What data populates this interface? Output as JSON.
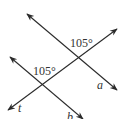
{
  "diagram": {
    "type": "parallel-lines-transversal",
    "lines": [
      {
        "name": "a",
        "label": "a",
        "from": [
          27,
          14
        ],
        "to": [
          117,
          90
        ]
      },
      {
        "name": "b",
        "label": "b",
        "from": [
          10,
          57
        ],
        "to": [
          83,
          119
        ]
      },
      {
        "name": "t",
        "label": "t",
        "from": [
          8,
          110
        ],
        "to": [
          117,
          29
        ]
      }
    ],
    "angles": [
      {
        "at": "intersection of t and a",
        "label": "105°"
      },
      {
        "at": "intersection of t and b",
        "label": "105°"
      }
    ],
    "stroke_color": "#2a2a2a",
    "text_color": "#333333"
  }
}
